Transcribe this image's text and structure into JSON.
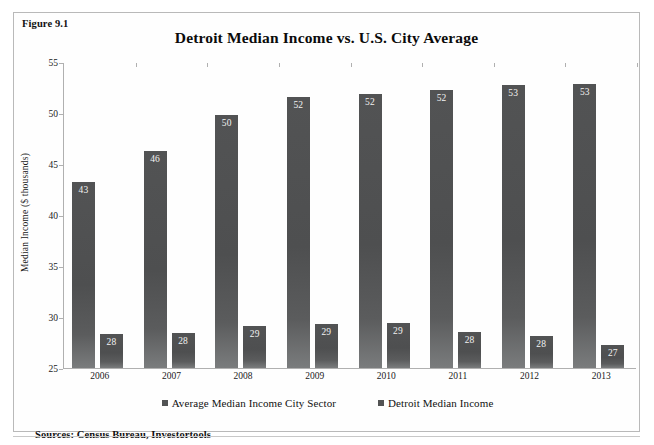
{
  "figure": {
    "label": "Figure 9.1",
    "source_note": "Sources: Census Bureau, Investortools"
  },
  "chart_data": {
    "type": "bar",
    "title": "Detroit Median Income vs. U.S. City Average",
    "xlabel": "",
    "ylabel": "Median Income ($ thousands)",
    "ylim": [
      25,
      55
    ],
    "yticks": [
      25,
      30,
      35,
      40,
      45,
      50,
      55
    ],
    "grid": false,
    "legend_position": "bottom",
    "categories": [
      "2006",
      "2007",
      "2008",
      "2009",
      "2010",
      "2011",
      "2012",
      "2013"
    ],
    "series": [
      {
        "name": "Average Median Income City Sector",
        "color": "#525354",
        "values": [
          43.2,
          46.3,
          49.8,
          51.6,
          51.9,
          52.3,
          52.7,
          52.8
        ],
        "labels": [
          "43",
          "46",
          "50",
          "52",
          "52",
          "52",
          "53",
          "53"
        ]
      },
      {
        "name": "Detroit Median Income",
        "color": "#525354",
        "values": [
          28.3,
          28.4,
          29.1,
          29.3,
          29.4,
          28.5,
          28.1,
          27.3
        ],
        "labels": [
          "28",
          "28",
          "29",
          "29",
          "29",
          "28",
          "28",
          "27"
        ]
      }
    ]
  }
}
